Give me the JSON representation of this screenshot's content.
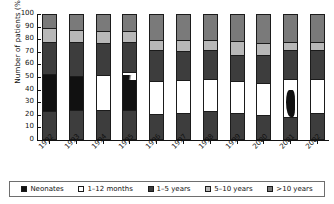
{
  "chart_data": {
    "type": "bar",
    "subtype": "stacked-bar-100-percent",
    "title": "",
    "xlabel": "",
    "ylabel": "Number of patients (%)",
    "ylim": [
      0,
      100
    ],
    "yticks": [
      0,
      10,
      20,
      30,
      40,
      50,
      60,
      70,
      80,
      90,
      100
    ],
    "grid": false,
    "legend_position": "bottom",
    "categories": [
      "1992",
      "1993",
      "1994",
      "1995",
      "1996",
      "1997",
      "1998",
      "1999",
      "2000",
      "2001",
      "2002"
    ],
    "series": [
      {
        "name": "Neonates",
        "color": "#111111",
        "values": [
          30,
          28,
          0,
          25,
          0,
          0,
          0,
          0,
          0,
          2,
          0
        ]
      },
      {
        "name": "1–12 months",
        "color": "#ffffff",
        "values": [
          0,
          0,
          28,
          2,
          26,
          26,
          26,
          25,
          26,
          30,
          27
        ]
      },
      {
        "name": "1–5 years",
        "color": "#3d3d3d",
        "values": [
          47,
          49,
          48,
          48,
          45,
          44,
          45,
          44,
          44,
          40,
          44
        ]
      },
      {
        "name": "5–10 years",
        "color": "#b8b8b8",
        "values": [
          11,
          10,
          10,
          9,
          8,
          9,
          8,
          11,
          9,
          9,
          6
        ]
      },
      {
        "name": ">10 years",
        "color": "#7a7a7a",
        "values": [
          12,
          13,
          14,
          16,
          21,
          21,
          21,
          20,
          21,
          19,
          23
        ]
      }
    ],
    "stack_order_bottom_to_top": [
      "1–5 years",
      "Neonates",
      "1–5 years",
      "5–10 years",
      ">10 years"
    ],
    "bars": [
      {
        "year": "1992",
        "segments": [
          {
            "series": "1–5 years",
            "from": 0,
            "to": 22
          },
          {
            "series": "Neonates",
            "from": 22,
            "to": 52
          },
          {
            "series": "1–5 years",
            "from": 52,
            "to": 77
          },
          {
            "series": "5–10 years",
            "from": 77,
            "to": 88
          },
          {
            "series": ">10 years",
            "from": 88,
            "to": 100
          }
        ]
      },
      {
        "year": "1993",
        "segments": [
          {
            "series": "1–5 years",
            "from": 0,
            "to": 23
          },
          {
            "series": "Neonates",
            "from": 23,
            "to": 50
          },
          {
            "series": "1–5 years",
            "from": 50,
            "to": 77
          },
          {
            "series": "5–10 years",
            "from": 77,
            "to": 87
          },
          {
            "series": ">10 years",
            "from": 87,
            "to": 100
          }
        ]
      },
      {
        "year": "1994",
        "segments": [
          {
            "series": "1–5 years",
            "from": 0,
            "to": 23
          },
          {
            "series": "1–12 months",
            "from": 23,
            "to": 51
          },
          {
            "series": "1–5 years",
            "from": 51,
            "to": 76
          },
          {
            "series": "5–10 years",
            "from": 76,
            "to": 86
          },
          {
            "series": ">10 years",
            "from": 86,
            "to": 100
          }
        ]
      },
      {
        "year": "1995",
        "segments": [
          {
            "series": "1–5 years",
            "from": 0,
            "to": 23
          },
          {
            "series": "Neonates",
            "from": 23,
            "to": 50
          },
          {
            "series": "1–12 months",
            "from": 50,
            "to": 53
          },
          {
            "series": "1–5 years",
            "from": 53,
            "to": 77
          },
          {
            "series": "5–10 years",
            "from": 77,
            "to": 86
          },
          {
            "series": ">10 years",
            "from": 86,
            "to": 100
          }
        ]
      },
      {
        "year": "1996",
        "segments": [
          {
            "series": "1–5 years",
            "from": 0,
            "to": 20
          },
          {
            "series": "1–12 months",
            "from": 20,
            "to": 46
          },
          {
            "series": "1–5 years",
            "from": 46,
            "to": 71
          },
          {
            "series": "5–10 years",
            "from": 71,
            "to": 79
          },
          {
            "series": ">10 years",
            "from": 79,
            "to": 100
          }
        ]
      },
      {
        "year": "1997",
        "segments": [
          {
            "series": "1–5 years",
            "from": 0,
            "to": 21
          },
          {
            "series": "1–12 months",
            "from": 21,
            "to": 47
          },
          {
            "series": "1–5 years",
            "from": 47,
            "to": 70
          },
          {
            "series": "5–10 years",
            "from": 70,
            "to": 79
          },
          {
            "series": ">10 years",
            "from": 79,
            "to": 100
          }
        ]
      },
      {
        "year": "1998",
        "segments": [
          {
            "series": "1–5 years",
            "from": 0,
            "to": 22
          },
          {
            "series": "1–12 months",
            "from": 22,
            "to": 48
          },
          {
            "series": "1–5 years",
            "from": 48,
            "to": 71
          },
          {
            "series": "5–10 years",
            "from": 71,
            "to": 79
          },
          {
            "series": ">10 years",
            "from": 79,
            "to": 100
          }
        ]
      },
      {
        "year": "1999",
        "segments": [
          {
            "series": "1–5 years",
            "from": 0,
            "to": 21
          },
          {
            "series": "1–12 months",
            "from": 21,
            "to": 46
          },
          {
            "series": "1–5 years",
            "from": 46,
            "to": 67
          },
          {
            "series": "5–10 years",
            "from": 67,
            "to": 78
          },
          {
            "series": ">10 years",
            "from": 78,
            "to": 100
          }
        ]
      },
      {
        "year": "2000",
        "segments": [
          {
            "series": "1–5 years",
            "from": 0,
            "to": 19
          },
          {
            "series": "1–12 months",
            "from": 19,
            "to": 45
          },
          {
            "series": "1–5 years",
            "from": 45,
            "to": 67
          },
          {
            "series": "5–10 years",
            "from": 67,
            "to": 76
          },
          {
            "series": ">10 years",
            "from": 76,
            "to": 100
          }
        ]
      },
      {
        "year": "2001",
        "segments": [
          {
            "series": "1–5 years",
            "from": 0,
            "to": 18
          },
          {
            "series": "1–12 months",
            "from": 18,
            "to": 48
          },
          {
            "series": "1–5 years",
            "from": 48,
            "to": 71
          },
          {
            "series": "5–10 years",
            "from": 71,
            "to": 77
          },
          {
            "series": ">10 years",
            "from": 77,
            "to": 100
          }
        ]
      },
      {
        "year": "2002",
        "segments": [
          {
            "series": "1–5 years",
            "from": 0,
            "to": 21
          },
          {
            "series": "1–12 months",
            "from": 21,
            "to": 48
          },
          {
            "series": "1–5 years",
            "from": 48,
            "to": 71
          },
          {
            "series": "5–10 years",
            "from": 71,
            "to": 77
          },
          {
            "series": ">10 years",
            "from": 77,
            "to": 100
          }
        ]
      }
    ],
    "legend": [
      {
        "label": "Neonates",
        "color": "#111111"
      },
      {
        "label": "1–12 months",
        "color": "#ffffff"
      },
      {
        "label": "1–5 years",
        "color": "#3d3d3d"
      },
      {
        "label": "5–10 years",
        "color": "#b8b8b8"
      },
      {
        "label": ">10 years",
        "color": "#7a7a7a"
      }
    ]
  }
}
